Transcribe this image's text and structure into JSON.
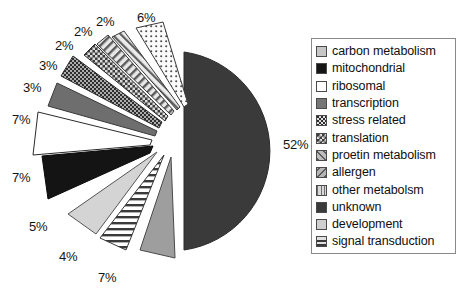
{
  "chart_data": {
    "type": "pie",
    "title": "",
    "exploded": true,
    "legend_position": "right",
    "categories": [
      "carbon metabolism",
      "mitochondrial",
      "ribosomal",
      "transcription",
      "stress related",
      "translation",
      "proetin metabolism",
      "allergen",
      "other metabolsm",
      "unknown",
      "development",
      "signal transduction"
    ],
    "values": [
      7,
      7,
      7,
      3,
      3,
      2,
      2,
      2,
      6,
      52,
      5,
      4
    ],
    "value_labels": [
      "7%",
      "7%",
      "7%",
      "3%",
      "3%",
      "2%",
      "2%",
      "2%",
      "6%",
      "52%",
      "5%",
      "4%"
    ],
    "slice_fills": [
      "#9e9e9e",
      "#141414",
      "#ffffff",
      "#6e6e6e",
      "#3d3d3d",
      "#4a4a4a",
      "#c9c9c9",
      "#d0d0d0",
      "#f2f2f2",
      "#3a3a3a",
      "#d4d4d4",
      "#ffffff"
    ],
    "slice_patterns": [
      "solid",
      "solid",
      "solid",
      "solid",
      "dots-dense",
      "checker",
      "diagonal",
      "back-diagonal",
      "grid-dots",
      "solid",
      "solid",
      "horizontal-lines"
    ]
  },
  "labels": [
    {
      "text": "2%",
      "x": 55,
      "y": 38
    },
    {
      "text": "2%",
      "x": 74,
      "y": 24
    },
    {
      "text": "2%",
      "x": 96,
      "y": 14
    },
    {
      "text": "6%",
      "x": 137,
      "y": 10
    },
    {
      "text": "3%",
      "x": 39,
      "y": 58
    },
    {
      "text": "3%",
      "x": 23,
      "y": 80
    },
    {
      "text": "7%",
      "x": 12,
      "y": 112
    },
    {
      "text": "7%",
      "x": 12,
      "y": 170
    },
    {
      "text": "5%",
      "x": 29,
      "y": 219
    },
    {
      "text": "4%",
      "x": 59,
      "y": 249
    },
    {
      "text": "7%",
      "x": 98,
      "y": 270
    },
    {
      "text": "52%",
      "x": 283,
      "y": 137
    }
  ],
  "legend": {
    "items": [
      {
        "label": "carbon metabolism",
        "pattern": "solid",
        "color": "#c6c6c6"
      },
      {
        "label": "mitochondrial",
        "pattern": "solid",
        "color": "#151515"
      },
      {
        "label": "ribosomal",
        "pattern": "solid",
        "color": "#ffffff"
      },
      {
        "label": "transcription",
        "pattern": "solid",
        "color": "#757575"
      },
      {
        "label": "stress related",
        "pattern": "checker-dense",
        "color": "#2b2b2b"
      },
      {
        "label": "translation",
        "pattern": "checker",
        "color": "#3c3c3c"
      },
      {
        "label": "proetin metabolism",
        "pattern": "diagonal",
        "color": "#bdbdbd"
      },
      {
        "label": "allergen",
        "pattern": "back-diagonal",
        "color": "#b5b5b5"
      },
      {
        "label": "other metabolsm",
        "pattern": "vertical-lines",
        "color": "#d8d8d8"
      },
      {
        "label": "unknown",
        "pattern": "solid",
        "color": "#3a3a3a"
      },
      {
        "label": "development",
        "pattern": "solid",
        "color": "#cfcfcf"
      },
      {
        "label": "signal transduction",
        "pattern": "horizontal-lines",
        "color": "#e0e0e0"
      }
    ]
  }
}
